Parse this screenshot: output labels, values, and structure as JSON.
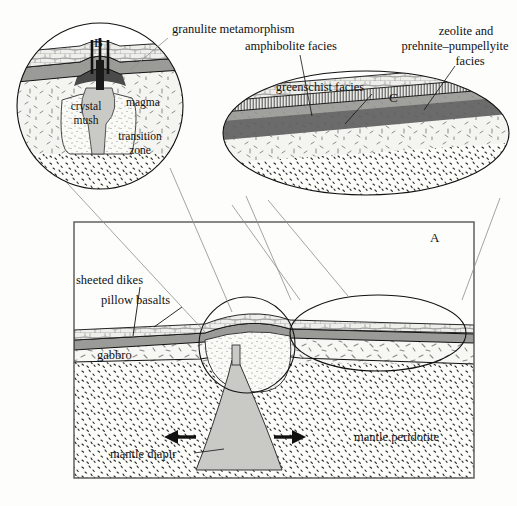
{
  "figure": {
    "background_color": "#fdfdfc",
    "ink_color": "#111111"
  },
  "panels": {
    "a": {
      "id": "A",
      "role": "main-cross-section"
    },
    "b": {
      "id": "B",
      "role": "ridge-axis-magma-chamber-inset"
    },
    "c": {
      "id": "C",
      "role": "metamorphic-facies-inset"
    }
  },
  "main_labels": {
    "sheeted_dikes": "sheeted dikes",
    "pillow_basalts": "pillow basalts",
    "gabbro": "gabbro",
    "mantle_peridotite": "mantle peridotite",
    "mantle_diapir": "mantle diapir"
  },
  "inset_b_labels": {
    "crystal_mush": "crystal mush",
    "crystal_mush_line1": "crystal",
    "crystal_mush_line2": "mush",
    "magma": "magma",
    "transition_zone_line1": "transition",
    "transition_zone_line2": "zone"
  },
  "facies_labels": {
    "granulite": "granulite metamorphism",
    "amphibolite": "amphibolite facies",
    "greenschist": "greenschist facies",
    "zeolite_line1": "zeolite  and",
    "zeolite_line2": "prehnite–pumpellyite",
    "zeolite_line3": "facies"
  },
  "icons": {
    "spreading_arrow_left": "arrow-left-icon",
    "spreading_arrow_right": "arrow-right-icon"
  },
  "colors": {
    "diapir_fill": "#c8c8c4",
    "magma_fill": "#555555",
    "greenschist_band": "#6e6e6e",
    "amphibolite_band": "#9a9a9a",
    "pillow_fill": "#efefec",
    "gabbro_fill": "#f6f6f3",
    "peridotite_fill": "#fbfbf8"
  }
}
